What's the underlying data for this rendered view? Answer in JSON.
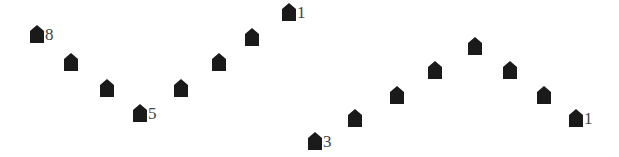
{
  "color": "#1a1a1a",
  "groups": [
    {
      "name": "left-v",
      "markers": [
        {
          "label": "8"
        },
        {
          "label": ""
        },
        {
          "label": ""
        },
        {
          "label": "5"
        },
        {
          "label": ""
        },
        {
          "label": ""
        },
        {
          "label": ""
        },
        {
          "label": "1"
        }
      ]
    },
    {
      "name": "right-peak",
      "markers": [
        {
          "label": "3"
        },
        {
          "label": ""
        },
        {
          "label": ""
        },
        {
          "label": ""
        },
        {
          "label": ""
        },
        {
          "label": ""
        },
        {
          "label": ""
        },
        {
          "label": "1"
        }
      ]
    }
  ]
}
